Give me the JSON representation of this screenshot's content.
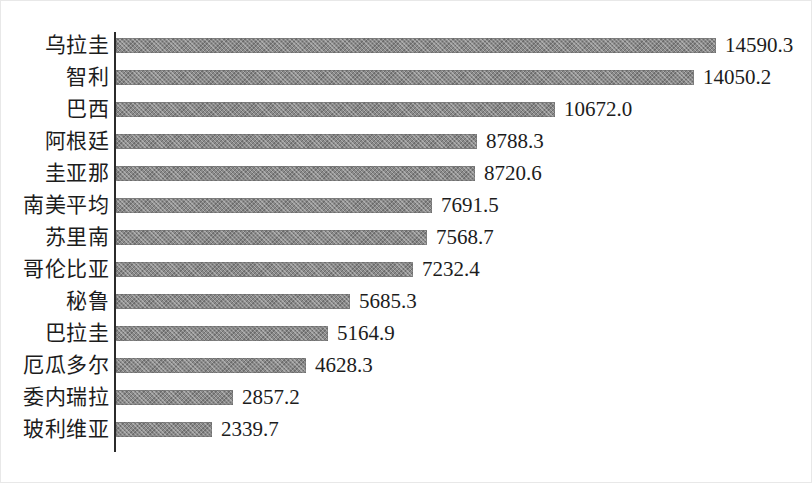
{
  "chart_data": {
    "type": "bar",
    "orientation": "horizontal",
    "title": "",
    "subtitle": "",
    "xlabel": "",
    "ylabel": "",
    "grid": false,
    "legend": null,
    "axis": {
      "value_axis_min": 0,
      "value_axis_max": 14590.3,
      "value_axis_visible_ticks": false,
      "category_axis_line": true
    },
    "data_labels": true,
    "bar_color": "#8a8a8a",
    "text_color": "#1c1c1c",
    "axis_color": "#2b2b2b",
    "categories": [
      "乌拉圭",
      "智利",
      "巴西",
      "阿根廷",
      "圭亚那",
      "南美平均",
      "苏里南",
      "哥伦比亚",
      "秘鲁",
      "巴拉圭",
      "厄瓜多尔",
      "委内瑞拉",
      "玻利维亚"
    ],
    "values": [
      14590.3,
      14050.2,
      10672.0,
      8788.3,
      8720.6,
      7691.5,
      7568.7,
      7232.4,
      5685.3,
      5164.9,
      4628.3,
      2857.2,
      2339.7
    ],
    "value_labels": [
      "14590.3",
      "14050.2",
      "10672.0",
      "8788.3",
      "8720.6",
      "7691.5",
      "7568.7",
      "7232.4",
      "5685.3",
      "5164.9",
      "4628.3",
      "2857.2",
      "2339.7"
    ]
  }
}
